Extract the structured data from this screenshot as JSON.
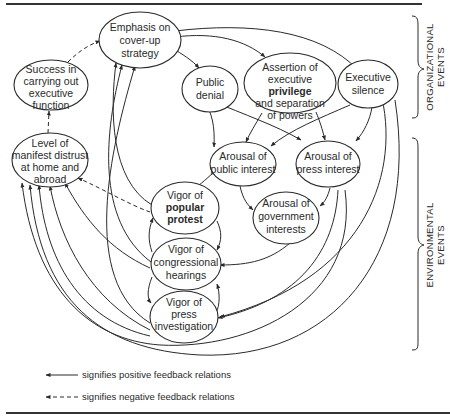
{
  "diagram": {
    "nodes": [
      {
        "id": "cover_up",
        "lines": [
          "Emphasis on",
          "cover-up",
          "strategy"
        ]
      },
      {
        "id": "success",
        "lines": [
          "Success in",
          "carrying out",
          "executive",
          "function"
        ]
      },
      {
        "id": "public_denial",
        "lines": [
          "Public",
          "denial"
        ]
      },
      {
        "id": "assertion",
        "lines": [
          "Assertion of",
          "executive",
          "privilege",
          "and separation",
          "of powers"
        ]
      },
      {
        "id": "exec_silence",
        "lines": [
          "Executive",
          "silence"
        ]
      },
      {
        "id": "distrust",
        "lines": [
          "Level of",
          "manifest distrust",
          "at home and",
          "abroad"
        ]
      },
      {
        "id": "public_interest",
        "lines": [
          "Arousal of",
          "public interest"
        ]
      },
      {
        "id": "press_interest",
        "lines": [
          "Arousal of",
          "press interest"
        ]
      },
      {
        "id": "gov_interests",
        "lines": [
          "Arousal of",
          "government",
          "interests"
        ]
      },
      {
        "id": "popular_protest",
        "lines": [
          "Vigor of",
          "popular",
          "protest"
        ]
      },
      {
        "id": "congress",
        "lines": [
          "Vigor of",
          "congressional",
          "hearings"
        ]
      },
      {
        "id": "press_invest",
        "lines": [
          "Vigor of",
          "press",
          "investigation"
        ]
      }
    ],
    "groups": [
      {
        "id": "organizational",
        "lines": [
          "ORGANIZATIONAL",
          "EVENTS"
        ]
      },
      {
        "id": "environmental",
        "lines": [
          "ENVIRONMENTAL",
          "EVENTS"
        ]
      }
    ],
    "legend": {
      "positive": "signifies positive feedback relations",
      "negative": "signifies negative feedback relations"
    }
  }
}
